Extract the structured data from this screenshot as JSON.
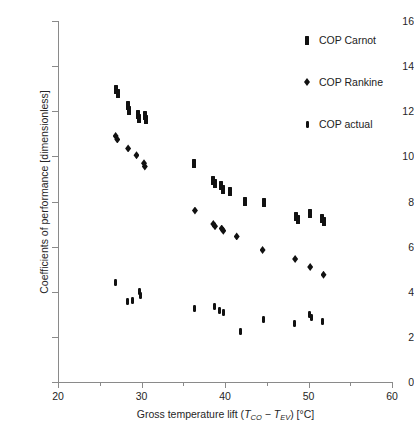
{
  "chart_data": {
    "type": "scatter",
    "title": "",
    "xlabel": "Gross temperature lift (TCO − TEV) [°C]",
    "xlabel_parts": {
      "pre": "Gross temperature lift (",
      "t1": "T",
      "sub1": "CO",
      "mid": " − ",
      "t2": "T",
      "sub2": "EV",
      "post": ") [°C]"
    },
    "ylabel": "Coefficients of performance [dimensionless]",
    "xlim": [
      20,
      60
    ],
    "ylim": [
      0,
      16
    ],
    "xticks": [
      20,
      30,
      40,
      50,
      60
    ],
    "xtick_labels": [
      "20",
      "30",
      "40",
      "50",
      "60"
    ],
    "yticks": [
      0,
      2,
      4,
      6,
      8,
      10,
      12,
      14,
      16
    ],
    "ytick_labels": [
      "0",
      "2",
      "4",
      "6",
      "8",
      "10",
      "12",
      "14",
      "16"
    ],
    "grid": false,
    "legend_position": "top-right",
    "marker_color": "#111111",
    "axis_color": "#8a8a8a",
    "series": [
      {
        "name": "COP Carnot",
        "marker": "rectangle",
        "points": [
          [
            26.9,
            12.95
          ],
          [
            27.2,
            12.8
          ],
          [
            28.4,
            12.25
          ],
          [
            28.5,
            12.05
          ],
          [
            29.6,
            11.85
          ],
          [
            29.7,
            11.7
          ],
          [
            30.4,
            11.8
          ],
          [
            30.5,
            11.65
          ],
          [
            36.3,
            9.7
          ],
          [
            38.6,
            8.95
          ],
          [
            38.8,
            8.8
          ],
          [
            39.5,
            8.7
          ],
          [
            39.8,
            8.55
          ],
          [
            40.6,
            8.45
          ],
          [
            42.4,
            8.0
          ],
          [
            44.7,
            7.95
          ],
          [
            48.5,
            7.35
          ],
          [
            48.7,
            7.2
          ],
          [
            50.2,
            7.45
          ],
          [
            51.6,
            7.25
          ],
          [
            51.8,
            7.1
          ]
        ]
      },
      {
        "name": "COP Rankine",
        "marker": "diamond",
        "points": [
          [
            26.9,
            10.9
          ],
          [
            27.1,
            10.75
          ],
          [
            28.4,
            10.35
          ],
          [
            29.4,
            10.05
          ],
          [
            30.3,
            9.7
          ],
          [
            30.4,
            9.55
          ],
          [
            36.4,
            7.6
          ],
          [
            38.6,
            7.0
          ],
          [
            38.8,
            6.9
          ],
          [
            39.6,
            6.8
          ],
          [
            39.8,
            6.7
          ],
          [
            41.4,
            6.45
          ],
          [
            44.5,
            5.85
          ],
          [
            48.4,
            5.45
          ],
          [
            50.2,
            5.1
          ],
          [
            51.8,
            4.75
          ]
        ]
      },
      {
        "name": "COP actual",
        "marker": "small-rectangle",
        "points": [
          [
            26.9,
            4.4
          ],
          [
            28.3,
            3.55
          ],
          [
            28.9,
            3.6
          ],
          [
            29.8,
            4.0
          ],
          [
            29.9,
            3.85
          ],
          [
            36.4,
            3.25
          ],
          [
            38.7,
            3.35
          ],
          [
            39.3,
            3.15
          ],
          [
            39.8,
            3.1
          ],
          [
            41.9,
            2.25
          ],
          [
            44.6,
            2.75
          ],
          [
            48.3,
            2.6
          ],
          [
            50.1,
            3.0
          ],
          [
            50.3,
            2.85
          ],
          [
            51.7,
            2.7
          ]
        ]
      }
    ]
  },
  "legend": {
    "items": [
      {
        "label": "COP Carnot",
        "marker": "carnot"
      },
      {
        "label": "COP Rankine",
        "marker": "rankine"
      },
      {
        "label": "COP actual",
        "marker": "actual"
      }
    ]
  }
}
